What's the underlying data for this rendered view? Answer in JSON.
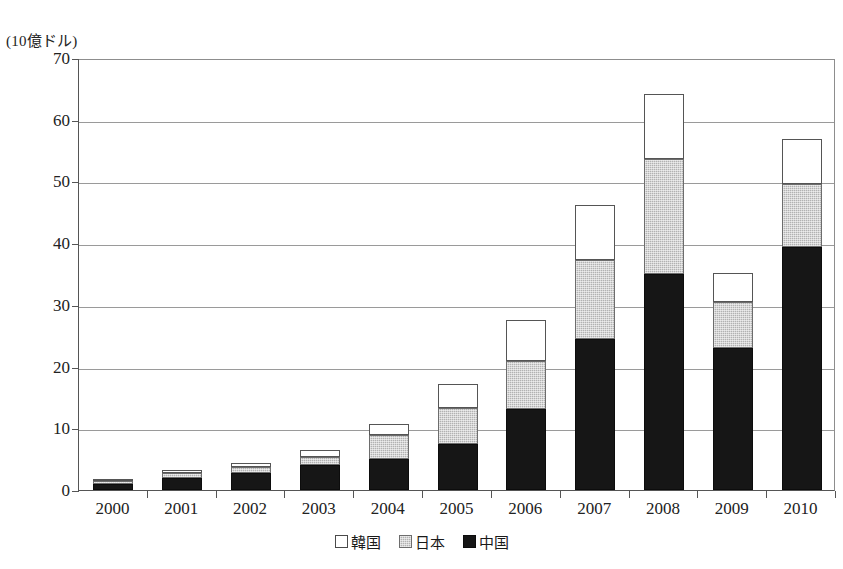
{
  "axis_unit_caption": "(10億ドル)",
  "chart_data": {
    "type": "bar",
    "subtype": "stacked-column",
    "title": "",
    "xlabel": "",
    "ylabel": "(10億ドル)",
    "ylim": [
      0,
      70
    ],
    "ytick_step": 10,
    "yticks": [
      "0",
      "10",
      "20",
      "30",
      "40",
      "50",
      "60",
      "70"
    ],
    "grid": true,
    "legend_position": "bottom-center",
    "categories": [
      "2000",
      "2001",
      "2002",
      "2003",
      "2004",
      "2005",
      "2006",
      "2007",
      "2008",
      "2009",
      "2010"
    ],
    "series": [
      {
        "name": "中国",
        "key": "cn",
        "color": "#161616",
        "values": [
          1.0,
          2.0,
          2.8,
          4.0,
          5.0,
          7.5,
          13.2,
          24.5,
          35.0,
          23.0,
          39.3
        ]
      },
      {
        "name": "日本",
        "key": "jp",
        "color": "#b2b2b2",
        "values": [
          0.5,
          0.8,
          1.0,
          1.4,
          3.9,
          5.8,
          7.7,
          12.8,
          18.7,
          7.4,
          10.3
        ]
      },
      {
        "name": "韓国",
        "key": "kr",
        "color": "#ffffff",
        "values": [
          0.3,
          0.5,
          0.6,
          1.1,
          1.8,
          3.9,
          6.7,
          8.9,
          10.4,
          4.7,
          7.2
        ]
      }
    ],
    "totals": [
      1.8,
      3.3,
      4.4,
      6.5,
      10.7,
      17.2,
      27.6,
      46.2,
      64.1,
      35.1,
      56.8
    ],
    "stack_order_bottom_to_top": [
      "中国",
      "日本",
      "韓国"
    ]
  },
  "legend": {
    "items": [
      {
        "label": "韓国",
        "key": "kr"
      },
      {
        "label": "日本",
        "key": "jp"
      },
      {
        "label": "中国",
        "key": "cn"
      }
    ]
  }
}
